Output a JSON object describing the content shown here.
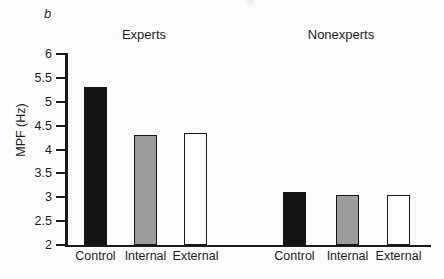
{
  "figure": {
    "panel_label": "b"
  },
  "chart_data": {
    "type": "bar",
    "title": "",
    "xlabel": "",
    "ylabel": "MPF (Hz)",
    "ylim": [
      2,
      6
    ],
    "yticks": [
      {
        "value": 2,
        "label": "2"
      },
      {
        "value": 2.5,
        "label": "2.5"
      },
      {
        "value": 3,
        "label": "3"
      },
      {
        "value": 3.5,
        "label": "3.5"
      },
      {
        "value": 4,
        "label": "4"
      },
      {
        "value": 4.5,
        "label": "4.5"
      },
      {
        "value": 5,
        "label": "5"
      },
      {
        "value": 5.5,
        "label": "5.5"
      },
      {
        "value": 6,
        "label": "6"
      }
    ],
    "grid": false,
    "legend": "none",
    "groups": [
      {
        "name": "Experts",
        "categories": [
          "Control",
          "Internal",
          "External"
        ],
        "values": [
          5.3,
          4.3,
          4.35
        ]
      },
      {
        "name": "Nonexperts",
        "categories": [
          "Control",
          "Internal",
          "External"
        ],
        "values": [
          3.1,
          3.05,
          3.05
        ]
      }
    ],
    "bar_colors": {
      "Control": "#141414",
      "Internal": "#9c9c9c",
      "External": "#ffffff"
    },
    "bar_border_color": "#141414"
  },
  "colors": {
    "background": "#fdfdfd",
    "text": "#1c1c1c",
    "axis": "#1a1a1a"
  }
}
